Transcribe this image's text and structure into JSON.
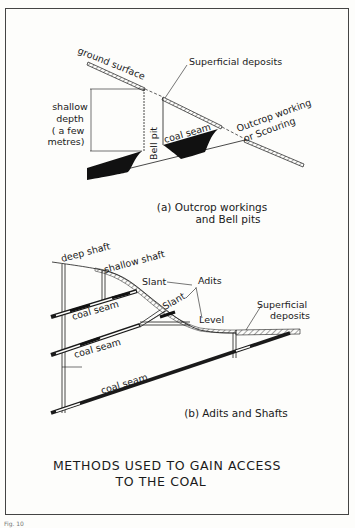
{
  "figure": {
    "caption": "Fig. 10",
    "title_line1": "METHODS  USED TO GAIN ACCESS",
    "title_line2": "TO THE COAL"
  },
  "panel_a": {
    "subtitle_line1": "(a) Outcrop workings",
    "subtitle_line2": "and  Bell pits",
    "labels": {
      "ground_surface": "ground surface",
      "superficial_deposits": "Superficial deposits",
      "shallow": "shallow",
      "depth": "depth",
      "a_few": "( a few",
      "metres": "metres)",
      "bell_pit": "Bell pit",
      "coal_seam": "coal seam",
      "outcrop_working": "Outcrop working",
      "or_scouring": "or Scouring"
    }
  },
  "panel_b": {
    "subtitle": "(b) Adits and Shafts",
    "labels": {
      "deep_shaft": "deep shaft",
      "shallow_shaft": "shallow shaft",
      "slant_1": "Slant",
      "slant_2": "Slant",
      "adits": "Adits",
      "level": "Level",
      "superficial": "Superficial",
      "deposits": "deposits",
      "coal_seam_1": "coal seam",
      "coal_seam_2": "coal seam",
      "coal_seam_3": "coal seam"
    }
  },
  "colors": {
    "ink": "#1a1a1a",
    "paper": "#fdfdfb",
    "frame": "#444444"
  }
}
